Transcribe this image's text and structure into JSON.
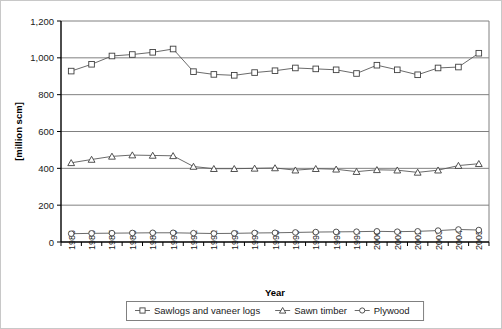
{
  "chart_data": {
    "type": "line",
    "title": "",
    "xlabel": "Year",
    "ylabel": "[million scm]",
    "ylim": [
      0,
      1200
    ],
    "ytick_step": 200,
    "ytick_labels": [
      "0",
      "200",
      "400",
      "600",
      "800",
      "1,000",
      "1,200"
    ],
    "grid": "horizontal",
    "legend_position": "bottom",
    "categories": [
      "1985",
      "1986",
      "1987",
      "1988",
      "1989",
      "1990",
      "1991",
      "1992",
      "1993",
      "1994",
      "1995",
      "1996",
      "1997",
      "1998",
      "1999",
      "2000",
      "2001",
      "2002",
      "2003",
      "2004",
      "2005"
    ],
    "series": [
      {
        "name": "Sawlogs and vaneer logs",
        "marker": "square",
        "values": [
          928,
          965,
          1010,
          1018,
          1030,
          1048,
          925,
          910,
          905,
          920,
          930,
          945,
          940,
          935,
          915,
          960,
          935,
          908,
          945,
          950,
          1025
        ]
      },
      {
        "name": "Sawn timber",
        "marker": "triangle",
        "values": [
          430,
          448,
          465,
          472,
          470,
          468,
          410,
          398,
          398,
          400,
          402,
          390,
          398,
          395,
          382,
          392,
          390,
          378,
          390,
          415,
          425
        ]
      },
      {
        "name": "Plywood",
        "marker": "circle",
        "values": [
          45,
          47,
          48,
          49,
          50,
          50,
          48,
          46,
          47,
          49,
          50,
          52,
          54,
          55,
          56,
          58,
          56,
          58,
          62,
          68,
          65
        ]
      }
    ]
  },
  "legend": {
    "items": [
      {
        "label": "Sawlogs and vaneer logs",
        "marker": "square"
      },
      {
        "label": "Sawn timber",
        "marker": "triangle"
      },
      {
        "label": "Plywood",
        "marker": "circle"
      }
    ]
  },
  "colors": {
    "line": "#595959",
    "marker_stroke": "#404040",
    "marker_fill": "#ffffff",
    "grid": "#808080",
    "axis": "#000000",
    "text": "#1a1a1a",
    "legend_border": "#808080",
    "outer_border": "#c8c8c8",
    "background": "#ffffff"
  }
}
